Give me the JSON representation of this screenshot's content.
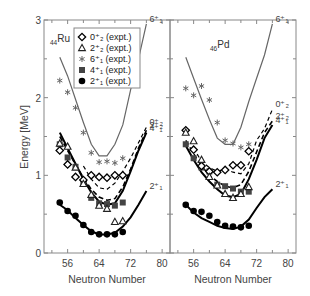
{
  "chart_data": {
    "type": "scatter",
    "title": "",
    "ylabel": "Energy [MeV]",
    "ylim": [
      0,
      3
    ],
    "yticks": [
      0,
      1,
      2,
      3
    ],
    "xlim": [
      50,
      82
    ],
    "xticks": [
      56,
      64,
      72,
      80
    ],
    "grid": false,
    "legend": {
      "placement": "top-left",
      "panel": "Ru",
      "entries": [
        {
          "key": "0p2",
          "marker": "open-diamond",
          "label": "0⁺₂ (expt.)"
        },
        {
          "key": "2p2",
          "marker": "open-triangle",
          "label": "2⁺₂ (expt.)"
        },
        {
          "key": "6p1",
          "marker": "asterisk",
          "label": "6⁺₁ (expt.)"
        },
        {
          "key": "4p1",
          "marker": "filled-square",
          "label": "4⁺₁ (expt.)"
        },
        {
          "key": "2p1",
          "marker": "filled-circle",
          "label": "2⁺₁ (expt.)"
        }
      ]
    },
    "panels": [
      {
        "name": "Ru",
        "label_sub": "44",
        "label_main": "Ru",
        "xlabel": "Neutron Number",
        "experiment": {
          "2p1": {
            "x": [
              54,
              56,
              58,
              60,
              62,
              64,
              66,
              68,
              70
            ],
            "y": [
              0.65,
              0.54,
              0.48,
              0.36,
              0.27,
              0.24,
              0.24,
              0.24,
              0.27
            ]
          },
          "4p1": {
            "x": [
              54,
              56,
              58,
              60,
              62,
              64,
              66,
              68,
              70
            ],
            "y": [
              1.4,
              1.23,
              1.11,
              0.89,
              0.71,
              0.64,
              0.63,
              0.61,
              0.65
            ]
          },
          "6p1": {
            "x": [
              54,
              56,
              58,
              60,
              62,
              64,
              66,
              68,
              70
            ],
            "y": [
              2.22,
              2.07,
              1.87,
              1.55,
              1.29,
              1.17,
              1.18,
              1.16,
              1.22
            ]
          },
          "0p2": {
            "x": [
              54,
              56,
              58,
              60,
              62,
              64,
              66,
              68,
              70
            ],
            "y": [
              1.32,
              1.14,
              0.98,
              0.94,
              1.0,
              0.98,
              0.97,
              1.0,
              1.0
            ]
          },
          "2p2": {
            "x": [
              54,
              56,
              58,
              60,
              62,
              64,
              66,
              68,
              70
            ],
            "y": [
              1.41,
              1.37,
              1.1,
              0.89,
              0.75,
              0.61,
              0.57,
              0.4,
              0.41
            ]
          }
        },
        "theory": [
          {
            "key": "2p1",
            "style": "solid-thick",
            "label": "2⁺₁",
            "x": [
              54,
              56,
              58,
              60,
              62,
              64,
              66,
              68,
              70,
              72,
              74,
              76
            ],
            "y": [
              0.62,
              0.55,
              0.45,
              0.36,
              0.28,
              0.24,
              0.24,
              0.26,
              0.34,
              0.46,
              0.62,
              0.8
            ]
          },
          {
            "key": "4p1",
            "style": "solid-thick",
            "label": "4⁺₁",
            "x": [
              54,
              56,
              58,
              60,
              62,
              64,
              66,
              68,
              70,
              72,
              74,
              76
            ],
            "y": [
              1.55,
              1.35,
              1.15,
              0.95,
              0.78,
              0.66,
              0.62,
              0.64,
              0.8,
              1.05,
              1.32,
              1.55
            ]
          },
          {
            "key": "2p2",
            "style": "dashed-thick",
            "label": "2⁺₂",
            "x": [
              54,
              56,
              58,
              60,
              62,
              64,
              66,
              68,
              70,
              72,
              74,
              76
            ],
            "y": [
              1.5,
              1.32,
              1.14,
              0.97,
              0.82,
              0.72,
              0.68,
              0.7,
              0.85,
              1.08,
              1.35,
              1.58
            ]
          },
          {
            "key": "0p2",
            "style": "dashed-thin",
            "label": "0⁺₂",
            "x": [
              60,
              62,
              64,
              66,
              68,
              70,
              72,
              74,
              76
            ],
            "y": [
              1.12,
              0.95,
              0.84,
              0.82,
              0.9,
              1.05,
              1.22,
              1.42,
              1.62
            ]
          },
          {
            "key": "6p1",
            "style": "solid-gray",
            "label": "6⁺₁",
            "x": [
              54,
              56,
              58,
              60,
              62,
              64,
              66,
              68,
              70,
              72,
              74,
              76
            ],
            "y": [
              2.52,
              2.28,
              1.98,
              1.68,
              1.4,
              1.25,
              1.25,
              1.4,
              1.65,
              2.1,
              2.5,
              2.95
            ]
          }
        ]
      },
      {
        "name": "Pd",
        "label_sub": "46",
        "label_main": "Pd",
        "xlabel": "Neutron Number",
        "experiment": {
          "2p1": {
            "x": [
              54,
              56,
              58,
              60,
              62,
              64,
              66,
              68,
              70
            ],
            "y": [
              0.62,
              0.54,
              0.53,
              0.48,
              0.4,
              0.35,
              0.34,
              0.33,
              0.35
            ]
          },
          "4p1": {
            "x": [
              54,
              56,
              58,
              60,
              62,
              64,
              66,
              68,
              70
            ],
            "y": [
              1.4,
              1.22,
              1.1,
              1.05,
              0.88,
              0.86,
              0.83,
              0.79,
              0.79
            ]
          },
          "6p1": {
            "x": [
              54,
              56,
              58,
              60,
              62,
              64,
              66,
              68,
              70
            ],
            "y": [
              2.12,
              2.03,
              2.15,
              1.97,
              1.68,
              1.45,
              1.41,
              1.36,
              1.4
            ]
          },
          "0p2": {
            "x": [
              54,
              56,
              58,
              60,
              62,
              64,
              66,
              68,
              70
            ],
            "y": [
              1.58,
              1.33,
              1.12,
              1.05,
              1.04,
              1.07,
              1.13,
              1.13,
              1.31
            ]
          },
          "2p2": {
            "x": [
              54,
              56,
              58,
              60,
              62,
              64,
              66,
              68,
              70
            ],
            "y": [
              1.55,
              1.44,
              1.2,
              0.98,
              0.87,
              0.76,
              0.71,
              0.76,
              0.85
            ]
          }
        },
        "theory": [
          {
            "key": "2p1",
            "style": "solid-thick",
            "label": "2⁺₁",
            "x": [
              54,
              56,
              58,
              60,
              62,
              64,
              66,
              68,
              70,
              72,
              74,
              76
            ],
            "y": [
              0.62,
              0.52,
              0.45,
              0.4,
              0.35,
              0.32,
              0.31,
              0.34,
              0.43,
              0.58,
              0.72,
              0.82
            ]
          },
          {
            "key": "4p1",
            "style": "solid-thick",
            "label": "4⁺₁",
            "x": [
              54,
              56,
              58,
              60,
              62,
              64,
              66,
              68,
              70,
              72,
              74,
              76
            ],
            "y": [
              1.38,
              1.2,
              1.04,
              0.92,
              0.82,
              0.74,
              0.72,
              0.76,
              0.95,
              1.2,
              1.48,
              1.65
            ]
          },
          {
            "key": "2p2",
            "style": "dashed-thick",
            "label": "2⁺₂",
            "x": [
              54,
              56,
              58,
              60,
              62,
              64,
              66,
              68,
              70,
              72,
              74,
              76
            ],
            "y": [
              1.45,
              1.28,
              1.12,
              1.0,
              0.92,
              0.86,
              0.84,
              0.88,
              1.05,
              1.3,
              1.55,
              1.7
            ]
          },
          {
            "key": "0p2",
            "style": "dashed-thin",
            "label": "0⁺₂",
            "x": [
              56,
              58,
              60,
              62,
              64,
              66,
              68,
              70,
              72,
              74,
              76
            ],
            "y": [
              1.35,
              1.18,
              1.1,
              1.05,
              1.08,
              1.04,
              1.02,
              1.15,
              1.45,
              1.6,
              1.85
            ]
          },
          {
            "key": "6p1",
            "style": "solid-gray",
            "label": "6⁺₁",
            "x": [
              54,
              56,
              58,
              60,
              62,
              64,
              66,
              68,
              70,
              72,
              74,
              76
            ],
            "y": [
              2.52,
              2.25,
              1.98,
              1.72,
              1.48,
              1.4,
              1.4,
              1.62,
              1.95,
              2.25,
              2.55,
              2.95
            ]
          }
        ]
      }
    ]
  }
}
